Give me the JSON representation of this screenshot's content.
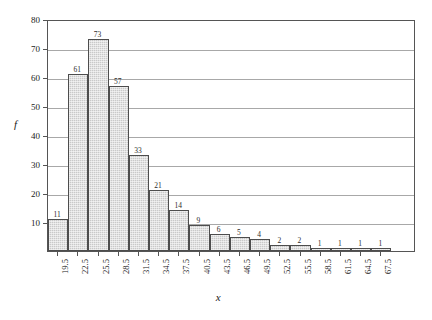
{
  "chart_data": {
    "type": "bar",
    "title": "",
    "subtitle": "",
    "xlabel": "x",
    "ylabel": "f",
    "categories": [
      "19.5",
      "22.5",
      "25.5",
      "28.5",
      "31.5",
      "34.5",
      "37.5",
      "40.5",
      "43.5",
      "46.5",
      "49.5",
      "52.5",
      "55.5",
      "58.5",
      "61.5",
      "64.5",
      "67.5"
    ],
    "values": [
      11,
      61,
      73,
      57,
      33,
      21,
      14,
      9,
      6,
      5,
      4,
      2,
      2,
      1,
      1,
      1,
      1
    ],
    "data_labels": [
      "11",
      "61",
      "73",
      "57",
      "33",
      "21",
      "14",
      "9",
      "6",
      "5",
      "4",
      "2",
      "2",
      "1",
      "1",
      "1",
      "1"
    ],
    "ylim": [
      0,
      80
    ],
    "xlim_note": "category axis, bin midpoints",
    "yticks": [
      10,
      20,
      30,
      40,
      50,
      60,
      70,
      80
    ],
    "ytick_labels": [
      "10",
      "20",
      "30",
      "40",
      "50",
      "60",
      "70",
      "80"
    ],
    "grid": "horizontal",
    "legend": null,
    "legend_position": "none",
    "bar_fill_color": "#c9c9c9",
    "bar_edge_color": "#4d4d4d",
    "gridline_color": "#a8a8a8",
    "frame_color": "#555555",
    "background_color": "#ffffff"
  }
}
